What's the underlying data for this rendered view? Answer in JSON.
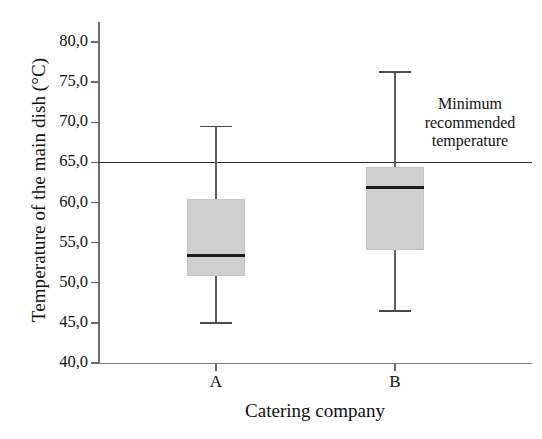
{
  "chart_data": {
    "type": "box",
    "title": "",
    "xlabel": "Catering company",
    "ylabel": "Temperature of the main dish (°C)",
    "categories": [
      "A",
      "B"
    ],
    "ylim": [
      40.0,
      82.5
    ],
    "yticks": [
      "40,0",
      "45,0",
      "50,0",
      "55,0",
      "60,0",
      "65,0",
      "70,0",
      "75,0",
      "80,0"
    ],
    "ytick_values": [
      40.0,
      45.0,
      50.0,
      55.0,
      60.0,
      65.0,
      70.0,
      75.0,
      80.0
    ],
    "grid": false,
    "legend": "none",
    "boxes": [
      {
        "name": "A",
        "whisker_low": 45.0,
        "q1": 50.8,
        "median": 53.4,
        "q3": 60.5,
        "whisker_high": 69.5
      },
      {
        "name": "B",
        "whisker_low": 46.5,
        "q1": 54.1,
        "median": 61.9,
        "q3": 64.4,
        "whisker_high": 76.3
      }
    ],
    "reference_line": {
      "value": 65.0,
      "label_lines": [
        "Minimum",
        "recommended",
        "temperature"
      ]
    },
    "colors": {
      "box_fill": "#cfcfcf",
      "median": "#1c1c1c",
      "whisker": "#5c5c5c",
      "axis": "#6e6e6e",
      "reference_line": "#2b2b2b",
      "text": "#111111"
    }
  }
}
